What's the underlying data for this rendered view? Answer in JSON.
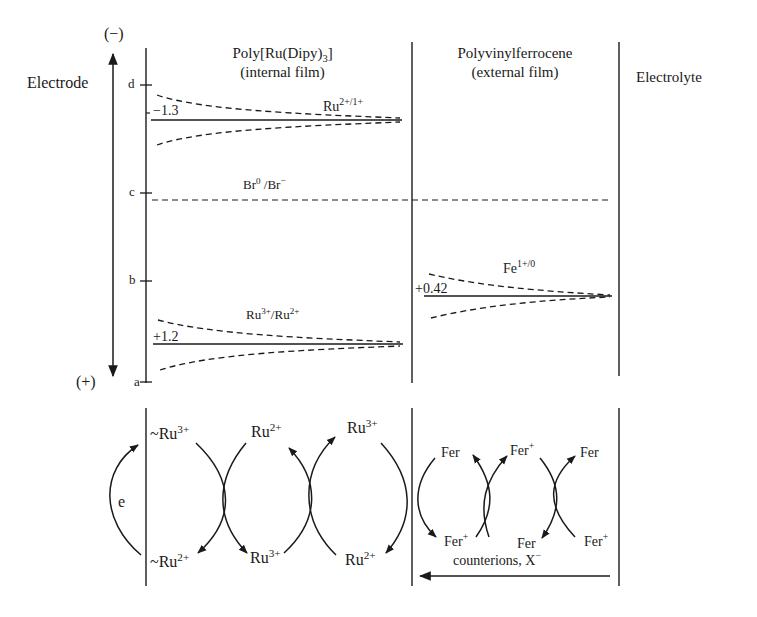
{
  "diagram": {
    "axis": {
      "top_sign": "(−)",
      "bottom_sign": "(+)",
      "electrode_label": "Electrode",
      "ticks": [
        {
          "label": "d",
          "y": 85
        },
        {
          "label": "c",
          "y": 193
        },
        {
          "label": "b",
          "y": 281
        },
        {
          "label": "a",
          "y": 382
        }
      ]
    },
    "columns": {
      "internal": {
        "line1": "Poly[Ru(Dipy)",
        "line1_sub": "3",
        "line1_end": "]",
        "line2": "(internal film)"
      },
      "external": {
        "line1": "Polyvinylferrocene",
        "line2": "(external film)"
      },
      "electrolyte": {
        "label": "Electrolyte"
      }
    },
    "levels": {
      "ru21": {
        "species": "Ru",
        "charge": "2+/1+",
        "potential": "−1.3"
      },
      "br": {
        "species_a": "Br",
        "charge_a": "0",
        "sep": " /",
        "species_b": "Br",
        "charge_b": "−"
      },
      "fe": {
        "species": "Fe",
        "charge": "1+/0",
        "potential": "+0.42"
      },
      "ru32": {
        "species_a": "Ru",
        "charge_a": "3+",
        "sep": "/",
        "species_b": "Ru",
        "charge_b": "2+",
        "potential": "+1.2"
      }
    },
    "mechanism": {
      "electron_label": "e",
      "ru_top": [
        {
          "prefix": "~",
          "species": "Ru",
          "charge": "3+"
        },
        {
          "prefix": "",
          "species": "Ru",
          "charge": "2+"
        },
        {
          "prefix": "",
          "species": "Ru",
          "charge": "3+"
        }
      ],
      "ru_bottom": [
        {
          "prefix": "~",
          "species": "Ru",
          "charge": "2+"
        },
        {
          "prefix": "",
          "species": "Ru",
          "charge": "3+"
        },
        {
          "prefix": "",
          "species": "Ru",
          "charge": "2+"
        }
      ],
      "fer_top": [
        {
          "species": "Fer",
          "charge": ""
        },
        {
          "species": "Fer",
          "charge": "+"
        },
        {
          "species": "Fer",
          "charge": ""
        }
      ],
      "fer_bottom": [
        {
          "species": "Fer",
          "charge": "+"
        },
        {
          "species": "Fer",
          "charge": ""
        },
        {
          "species": "Fer",
          "charge": "+"
        }
      ],
      "counterion_label": "counterions, X",
      "counterion_charge": "−"
    }
  }
}
